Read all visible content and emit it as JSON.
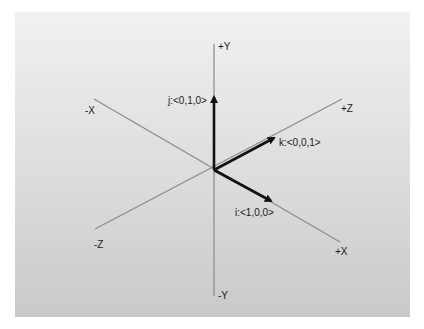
{
  "diagram": {
    "axes": {
      "pos_y": "+Y",
      "neg_y": "-Y",
      "pos_x": "+X",
      "neg_x": "-X",
      "pos_z": "+Z",
      "neg_z": "-Z"
    },
    "vectors": {
      "i": "i:<1,0,0>",
      "j": "j:<0,1,0>",
      "k": "k:<0,0,1>"
    },
    "colors": {
      "axis_line": "#8a8a8a",
      "vector": "#111111",
      "text": "#1a1a1a"
    }
  }
}
